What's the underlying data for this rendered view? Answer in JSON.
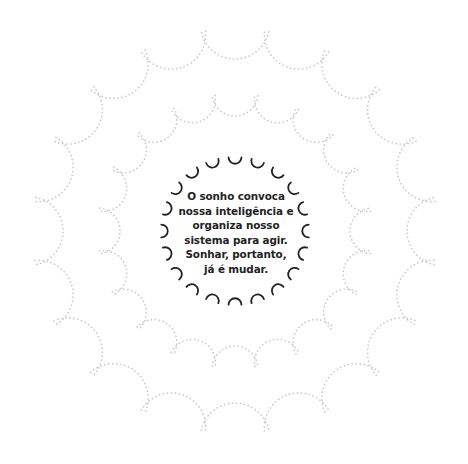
{
  "quote": {
    "lines": [
      "O sonho convoca",
      "nossa inteligência e",
      "organiza nosso",
      "sistema para agir.",
      "Sonhar, portanto,",
      "já é mudar."
    ]
  },
  "rings": {
    "center": [
      235,
      231
    ],
    "outer": {
      "count": 20,
      "cusp_radius": 202,
      "inner_radius": 172,
      "style": "dotted",
      "color": "#c9c9c9"
    },
    "middle": {
      "count": 20,
      "cusp_radius": 137,
      "inner_radius": 115,
      "style": "dotted",
      "color": "#c9c9c9"
    },
    "inner": {
      "count": 20,
      "end_radius": 74,
      "inner_radius": 67,
      "half_angle_deg": 5,
      "style": "solid",
      "color": "#222222"
    }
  }
}
